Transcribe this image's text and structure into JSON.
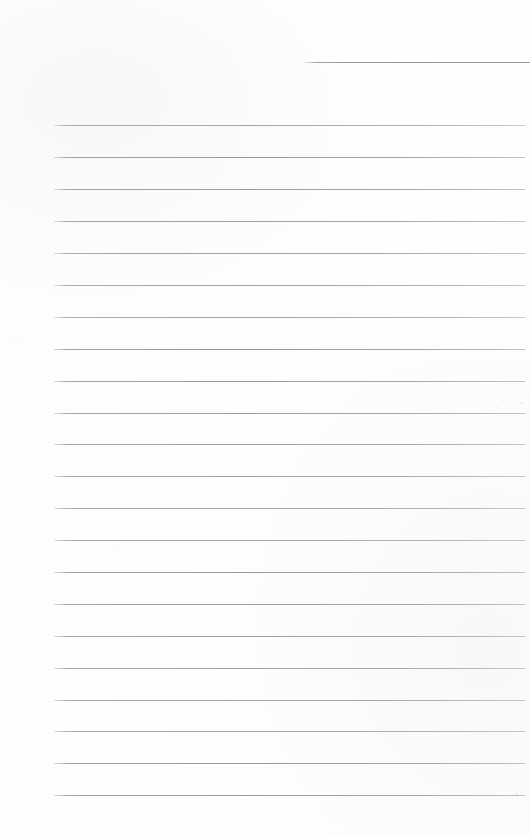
{
  "document": {
    "type": "ruled-notebook-page",
    "title": "",
    "body_text": "",
    "page_number": "",
    "width_px": 530,
    "height_px": 835,
    "background_color": "#fefefe",
    "rule_color": "#929292",
    "content_state": "blank"
  },
  "header_rule": {
    "label": "header-rule",
    "x_start": 304,
    "x_end": 530,
    "y": 62,
    "thickness": 1
  },
  "rules": {
    "label": "body-ruled-lines",
    "count": 22,
    "x_start": 54,
    "x_end": 525,
    "first_y": 125,
    "spacing": 31.9,
    "thickness": 1,
    "y_positions": [
      125,
      157,
      189,
      221,
      253,
      285,
      317,
      349,
      381,
      413,
      444,
      476,
      508,
      540,
      572,
      604,
      636,
      668,
      700,
      731,
      763,
      795
    ]
  },
  "specks": [
    {
      "x": 521,
      "y": 402,
      "size": 2
    },
    {
      "x": 516,
      "y": 793,
      "size": 2
    },
    {
      "x": 311,
      "y": 274,
      "size": 1
    }
  ]
}
